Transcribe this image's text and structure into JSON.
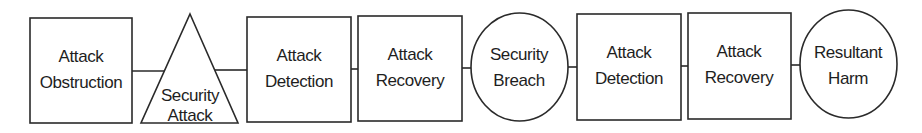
{
  "diagram": {
    "type": "flow",
    "nodes": [
      {
        "id": "attack-obstruction",
        "shape": "rect",
        "lines": [
          "Attack",
          "Obstruction"
        ]
      },
      {
        "id": "security-attack",
        "shape": "triangle",
        "lines": [
          "Security",
          "Attack"
        ]
      },
      {
        "id": "attack-detection-1",
        "shape": "rect",
        "lines": [
          "Attack",
          "Detection"
        ]
      },
      {
        "id": "attack-recovery-1",
        "shape": "rect",
        "lines": [
          "Attack",
          "Recovery"
        ]
      },
      {
        "id": "security-breach",
        "shape": "circle",
        "lines": [
          "Security",
          "Breach"
        ]
      },
      {
        "id": "attack-detection-2",
        "shape": "rect",
        "lines": [
          "Attack",
          "Detection"
        ]
      },
      {
        "id": "attack-recovery-2",
        "shape": "rect",
        "lines": [
          "Attack",
          "Recovery"
        ]
      },
      {
        "id": "resultant-harm",
        "shape": "circle",
        "lines": [
          "Resultant",
          "Harm"
        ]
      }
    ],
    "edges": [
      [
        "attack-obstruction",
        "security-attack"
      ],
      [
        "security-attack",
        "attack-detection-1"
      ],
      [
        "attack-detection-1",
        "attack-recovery-1"
      ],
      [
        "attack-recovery-1",
        "security-breach"
      ],
      [
        "security-breach",
        "attack-detection-2"
      ],
      [
        "attack-detection-2",
        "attack-recovery-2"
      ],
      [
        "attack-recovery-2",
        "resultant-harm"
      ]
    ],
    "colors": {
      "stroke": "#2a2a2a",
      "text": "#1e1e1e",
      "background": "#ffffff"
    }
  }
}
